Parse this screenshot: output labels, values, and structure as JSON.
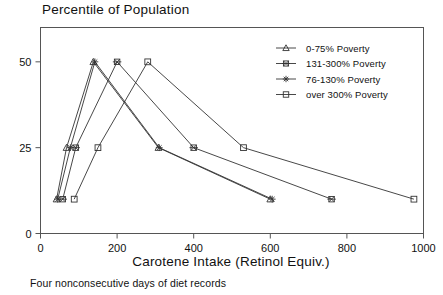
{
  "chart_data": {
    "type": "line",
    "title": "Percentile of Population",
    "xlabel": "Carotene Intake (Retinol Equiv.)",
    "ylabel": "",
    "footnote": "Four nonconsecutive days of diet records",
    "xlim": [
      0,
      1000
    ],
    "ylim": [
      0,
      60
    ],
    "xticks": [
      0,
      200,
      400,
      600,
      800,
      1000
    ],
    "yticks": [
      0,
      25,
      50
    ],
    "xtick_labels": [
      "0",
      "200",
      "400",
      "600",
      "800",
      "1000"
    ],
    "ytick_labels": [
      "0",
      "25",
      "50"
    ],
    "grid": false,
    "legend_position": "top-right",
    "series": [
      {
        "name": "0-75% Poverty",
        "marker": "triangle",
        "x": [
          42,
          68,
          138,
          308,
          600
        ],
        "y": [
          10,
          25,
          50,
          25,
          10
        ]
      },
      {
        "name": "131-300% Poverty",
        "marker": "boxed-x",
        "x": [
          58,
          92,
          200,
          400,
          760
        ],
        "y": [
          10,
          25,
          50,
          25,
          10
        ]
      },
      {
        "name": "76-130% Poverty",
        "marker": "star",
        "x": [
          45,
          78,
          142,
          310,
          605
        ],
        "y": [
          10,
          25,
          50,
          25,
          10
        ]
      },
      {
        "name": "over 300% Poverty",
        "marker": "square",
        "x": [
          88,
          150,
          280,
          530,
          975
        ],
        "y": [
          10,
          25,
          50,
          25,
          10
        ]
      }
    ]
  },
  "legend": {
    "entries": [
      {
        "label": "0-75% Poverty",
        "marker": "triangle"
      },
      {
        "label": "131-300% Poverty",
        "marker": "boxed-x"
      },
      {
        "label": "76-130% Poverty",
        "marker": "star"
      },
      {
        "label": "over 300% Poverty",
        "marker": "square"
      }
    ]
  }
}
